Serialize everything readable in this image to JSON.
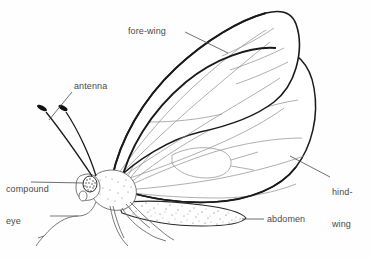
{
  "figure": {
    "kind": "scientific-illustration",
    "background_color": "#fefefe",
    "line_color": "#1a1a1a",
    "vein_color": "#8a8a8a",
    "text_color": "#4a4a4a"
  },
  "labels": {
    "forewing": "fore-wing",
    "antenna": "antenna",
    "compound_eye_line1": "compound",
    "compound_eye_line2": "eye",
    "hindwing_line1": "hind-",
    "hindwing_line2": "wing",
    "abdomen": "abdomen"
  },
  "parts": [
    {
      "id": "fore-wing",
      "label": "fore-wing",
      "leader_from": [
        188,
        32
      ],
      "leader_to": [
        228,
        52
      ]
    },
    {
      "id": "antenna",
      "label": "antenna",
      "leader_from": [
        72,
        92
      ],
      "leader_to": [
        48,
        118
      ]
    },
    {
      "id": "compound-eye",
      "label": "compound eye",
      "leader_from": [
        30,
        182
      ],
      "leader_to": [
        88,
        182
      ]
    },
    {
      "id": "hind-wing",
      "label": "hind-wing",
      "leader_from": [
        330,
        180
      ],
      "leader_to": [
        291,
        156
      ]
    },
    {
      "id": "abdomen",
      "label": "abdomen",
      "leader_from": [
        264,
        220
      ],
      "leader_to": [
        243,
        219
      ]
    }
  ]
}
